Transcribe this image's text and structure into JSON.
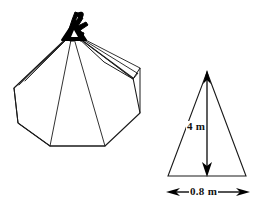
{
  "figure": {
    "background_color": "#ffffff",
    "stroke_color": "#1a1a1a",
    "fill_color": "#000000",
    "title_visible": false
  },
  "tepee": {
    "name": "tepee-illustration",
    "description": "line drawing of a conical tepee tent with crossed poles at the apex",
    "apex": {
      "x": 72,
      "y": 33
    },
    "knot_fill": "#000000",
    "pole_lines": [
      {
        "x1": 72,
        "y1": 33,
        "x2": 14,
        "y2": 88
      },
      {
        "x1": 72,
        "y1": 33,
        "x2": 18,
        "y2": 86
      },
      {
        "x1": 72,
        "y1": 33,
        "x2": 23,
        "y2": 83
      },
      {
        "x1": 72,
        "y1": 33,
        "x2": 50,
        "y2": 146
      },
      {
        "x1": 72,
        "y1": 33,
        "x2": 105,
        "y2": 146
      },
      {
        "x1": 72,
        "y1": 33,
        "x2": 133,
        "y2": 78
      },
      {
        "x1": 72,
        "y1": 33,
        "x2": 137,
        "y2": 72
      },
      {
        "x1": 72,
        "y1": 33,
        "x2": 140,
        "y2": 67
      }
    ],
    "outline_points": "72,33 14,88 18,123 50,146 105,146 140,113 133,78",
    "flap_points": "72,33 103,62 133,78 137,72"
  },
  "triangle": {
    "name": "dimension-triangle",
    "apex": {
      "x": 207,
      "y": 72
    },
    "base_left": {
      "x": 168,
      "y": 176
    },
    "base_right": {
      "x": 246,
      "y": 176
    },
    "height_arrow": {
      "label": "4 m",
      "orientation": "vertical",
      "double_headed": true,
      "x": 207,
      "y_top": 72,
      "y_bottom": 176
    },
    "base_arrow": {
      "label": "0.8 m",
      "orientation": "horizontal",
      "double_headed": true,
      "y": 192,
      "x_left": 168,
      "x_right": 248
    }
  },
  "labels": {
    "height": "4 m",
    "base": "0.8 m"
  }
}
